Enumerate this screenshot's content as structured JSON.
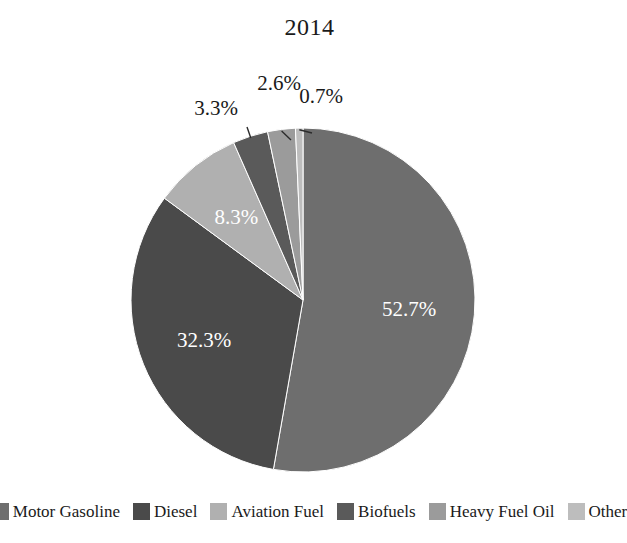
{
  "chart_data": {
    "type": "pie",
    "title": "2014",
    "xlabel": "",
    "ylabel": "",
    "legend_position": "bottom",
    "grid": false,
    "start_angle_deg": 0,
    "direction": "clockwise",
    "label_format": "percent-one-decimal",
    "categories": [
      "Motor Gasoline",
      "Diesel",
      "Aviation Fuel",
      "Biofuels",
      "Heavy Fuel Oil",
      "Other"
    ],
    "values": [
      52.7,
      32.3,
      8.3,
      3.3,
      2.6,
      0.7
    ],
    "labels": [
      "52.7%",
      "32.3%",
      "8.3%",
      "3.3%",
      "2.6%",
      "0.7%"
    ],
    "colors": [
      "#6e6e6e",
      "#4a4a4a",
      "#b0b0b0",
      "#5a5a5a",
      "#9b9b9b",
      "#bdbdbd"
    ],
    "label_placement": [
      "inside",
      "inside",
      "inside",
      "outside",
      "outside",
      "outside"
    ]
  },
  "title": {
    "text": "2014"
  },
  "slices": [
    {
      "name": "Motor Gasoline",
      "label": "52.7%",
      "value": 52.7,
      "color": "#6e6e6e"
    },
    {
      "name": "Diesel",
      "label": "32.3%",
      "value": 32.3,
      "color": "#4a4a4a"
    },
    {
      "name": "Aviation Fuel",
      "label": "8.3%",
      "value": 8.3,
      "color": "#b0b0b0"
    },
    {
      "name": "Biofuels",
      "label": "3.3%",
      "value": 3.3,
      "color": "#5a5a5a"
    },
    {
      "name": "Heavy Fuel Oil",
      "label": "2.6%",
      "value": 2.6,
      "color": "#9b9b9b"
    },
    {
      "name": "Other",
      "label": "0.7%",
      "value": 0.7,
      "color": "#bdbdbd"
    }
  ],
  "legend": {
    "items": [
      {
        "label": "Motor Gasoline",
        "color": "#6e6e6e"
      },
      {
        "label": "Diesel",
        "color": "#4a4a4a"
      },
      {
        "label": "Aviation Fuel",
        "color": "#b0b0b0"
      },
      {
        "label": "Biofuels",
        "color": "#5a5a5a"
      },
      {
        "label": "Heavy Fuel Oil",
        "color": "#9b9b9b"
      },
      {
        "label": "Other",
        "color": "#bdbdbd"
      }
    ]
  }
}
